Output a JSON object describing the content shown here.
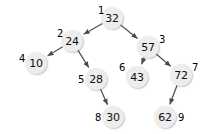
{
  "figure": {
    "type": "tree-diagram",
    "width": 210,
    "height": 134,
    "background_color": "#ffffff",
    "node_fill_color": "#ededed",
    "node_text_color": "#101010",
    "index_label_color": "#000000",
    "edge_color": "#555555"
  },
  "chart_data": {
    "type": "tree",
    "node_count": 9,
    "edge_count": 8,
    "root_id": "n1",
    "nodes": [
      {
        "id": "n1",
        "value": "32",
        "index": "1",
        "cx": 112,
        "cy": 18,
        "r": 11,
        "index_dx": -14,
        "index_dy": -12,
        "depth": 0
      },
      {
        "id": "n2",
        "value": "24",
        "index": "2",
        "cx": 72,
        "cy": 41,
        "r": 11,
        "index_dx": -15,
        "index_dy": -12,
        "depth": 1
      },
      {
        "id": "n3",
        "value": "57",
        "index": "3",
        "cx": 148,
        "cy": 47,
        "r": 11,
        "index_dx": 11,
        "index_dy": -12,
        "depth": 1
      },
      {
        "id": "n4",
        "value": "10",
        "index": "4",
        "cx": 36,
        "cy": 63,
        "r": 11,
        "index_dx": -17,
        "index_dy": -9,
        "depth": 2
      },
      {
        "id": "n5",
        "value": "28",
        "index": "5",
        "cx": 96,
        "cy": 79,
        "r": 11,
        "index_dx": -18,
        "index_dy": -4,
        "depth": 2
      },
      {
        "id": "n6",
        "value": "43",
        "index": "6",
        "cx": 137,
        "cy": 77,
        "r": 11,
        "index_dx": -18,
        "index_dy": -14,
        "depth": 2
      },
      {
        "id": "n7",
        "value": "72",
        "index": "7",
        "cx": 181,
        "cy": 75,
        "r": 11,
        "index_dx": 11,
        "index_dy": -12,
        "depth": 2
      },
      {
        "id": "n8",
        "value": "30",
        "index": "8",
        "cx": 113,
        "cy": 117,
        "r": 11,
        "index_dx": -18,
        "index_dy": -4,
        "depth": 3
      },
      {
        "id": "n9",
        "value": "62",
        "index": "9",
        "cx": 165,
        "cy": 117,
        "r": 11,
        "index_dx": 13,
        "index_dy": -4,
        "depth": 3
      }
    ],
    "edges": [
      {
        "from": "n1",
        "to": "n2",
        "side": "left"
      },
      {
        "from": "n1",
        "to": "n3",
        "side": "right"
      },
      {
        "from": "n2",
        "to": "n4",
        "side": "left"
      },
      {
        "from": "n2",
        "to": "n5",
        "side": "right"
      },
      {
        "from": "n3",
        "to": "n6",
        "side": "left"
      },
      {
        "from": "n3",
        "to": "n7",
        "side": "right"
      },
      {
        "from": "n5",
        "to": "n8",
        "side": "right"
      },
      {
        "from": "n7",
        "to": "n9",
        "side": "left"
      }
    ],
    "values_in_order": [
      "10",
      "24",
      "28",
      "30",
      "32",
      "43",
      "57",
      "62",
      "72"
    ],
    "index_labels": [
      "1",
      "2",
      "3",
      "4",
      "5",
      "6",
      "7",
      "8",
      "9"
    ]
  }
}
